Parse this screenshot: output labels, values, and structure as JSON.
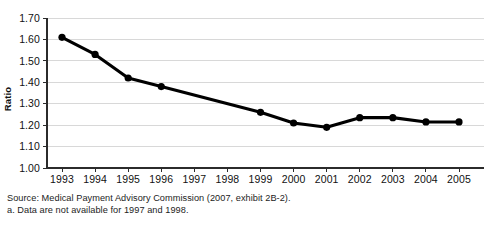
{
  "top_remnant": "",
  "chart_data": {
    "type": "line",
    "title": "",
    "xlabel": "",
    "ylabel": "Ratio",
    "x": [
      1993,
      1994,
      1995,
      1996,
      1997,
      1998,
      1999,
      2000,
      2001,
      2002,
      2003,
      2004,
      2005
    ],
    "categories": [
      "1993",
      "1994",
      "1995",
      "1996",
      "1997",
      "1998",
      "1999",
      "2000",
      "2001",
      "2002",
      "2003",
      "2004",
      "2005"
    ],
    "values": [
      1.61,
      1.53,
      1.42,
      1.38,
      null,
      null,
      1.26,
      1.21,
      1.19,
      1.235,
      1.235,
      1.215,
      1.215
    ],
    "series": [
      {
        "name": "Ratio",
        "values": [
          1.61,
          1.53,
          1.42,
          1.38,
          null,
          null,
          1.26,
          1.21,
          1.19,
          1.235,
          1.235,
          1.215,
          1.215
        ],
        "color": "#000000",
        "marker": "circle"
      }
    ],
    "ylim": [
      1.0,
      1.7
    ],
    "ytick_labels": [
      "1.70",
      "1.60",
      "1.50",
      "1.40",
      "1.30",
      "1.20",
      "1.10",
      "1.00"
    ],
    "ytick_values": [
      1.7,
      1.6,
      1.5,
      1.4,
      1.3,
      1.2,
      1.1,
      1.0
    ],
    "xtick_labels": [
      "1993",
      "1994",
      "1995",
      "1996",
      "1997",
      "1998",
      "1999",
      "2000",
      "2001",
      "2002",
      "2003",
      "2004",
      "2005"
    ],
    "grid": "horizontal",
    "legend": "none",
    "missing_data_years": [
      "1997",
      "1998"
    ],
    "line_color": "#000000",
    "grid_color": "#c8c8c8",
    "axis_color": "#2b2b2b"
  },
  "footnotes": {
    "source": "Source: Medical Payment Advisory Commission (2007, exhibit 2B-2).",
    "note_a": "a. Data are not available for 1997 and 1998."
  }
}
